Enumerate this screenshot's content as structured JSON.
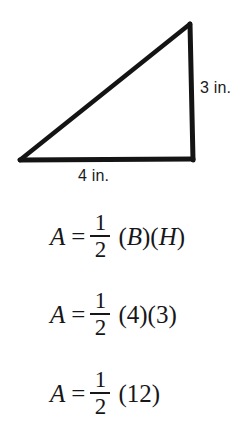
{
  "figure": {
    "name": "right-triangle-diagram",
    "shape": "right triangle",
    "stroke_color": "#141414",
    "fill_color": "#ffffff",
    "background_color": "#ffffff",
    "vertices": {
      "bottom_left": [
        20,
        160
      ],
      "bottom_right": [
        193,
        160
      ],
      "apex": [
        190,
        23
      ]
    },
    "labels": {
      "height": "3 in.",
      "base": "4 in."
    }
  },
  "equations": [
    {
      "name": "area-formula",
      "variable": "A",
      "equals": "=",
      "fraction": {
        "numerator": "1",
        "denominator": "2"
      },
      "tail": [
        {
          "text": "(",
          "style": "paren"
        },
        {
          "text": "B",
          "style": "sym"
        },
        {
          "text": ")(",
          "style": "paren"
        },
        {
          "text": "H",
          "style": "sym"
        },
        {
          "text": ")",
          "style": "paren"
        }
      ],
      "plain": "A = 1/2 (B)(H)"
    },
    {
      "name": "area-substituted",
      "variable": "A",
      "equals": "=",
      "fraction": {
        "numerator": "1",
        "denominator": "2"
      },
      "tail": [
        {
          "text": "(",
          "style": "paren"
        },
        {
          "text": "4",
          "style": "num"
        },
        {
          "text": ")(",
          "style": "paren"
        },
        {
          "text": "3",
          "style": "num"
        },
        {
          "text": ")",
          "style": "paren"
        }
      ],
      "plain": "A = 1/2 (4)(3)"
    },
    {
      "name": "area-product",
      "variable": "A",
      "equals": "=",
      "fraction": {
        "numerator": "1",
        "denominator": "2"
      },
      "tail": [
        {
          "text": "(",
          "style": "paren"
        },
        {
          "text": "12",
          "style": "num"
        },
        {
          "text": ")",
          "style": "paren"
        }
      ],
      "plain": "A = 1/2 (12)"
    }
  ]
}
